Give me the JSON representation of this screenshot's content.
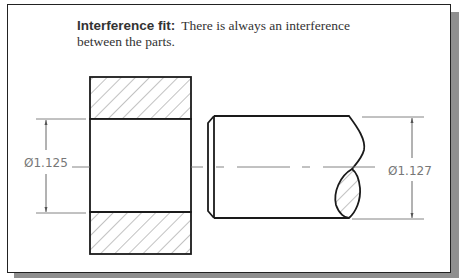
{
  "caption": {
    "term": "Interference fit:",
    "description_line1": "There is always an interference",
    "description_line2": "between the parts."
  },
  "dimensions": {
    "hole": "Ø1.125",
    "shaft": "Ø1.127"
  },
  "parts": {
    "hub": "Hub (hatched section with bore)",
    "shaft": "Shaft with chamfer and break"
  },
  "colors": {
    "outline": "#1a1a1a",
    "hatch": "#666666",
    "dimension": "#777777",
    "shadow": "#8f8f8f"
  }
}
